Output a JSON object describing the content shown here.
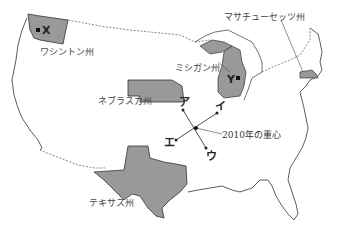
{
  "map": {
    "states": [
      {
        "name": "ワシントン州",
        "fill": "#999999"
      },
      {
        "name": "ネブラスカ州",
        "fill": "#999999"
      },
      {
        "name": "テキサス州",
        "fill": "#999999"
      },
      {
        "name": "ミシガン州",
        "fill": "#999999"
      },
      {
        "name": "マサチューセッツ州",
        "fill": "#999999"
      }
    ],
    "markers": {
      "x": "X",
      "y": "Y"
    },
    "center": {
      "label": "2010年の重心",
      "directions": {
        "a": "ア",
        "i": "イ",
        "u": "ウ",
        "e": "エ"
      }
    }
  }
}
